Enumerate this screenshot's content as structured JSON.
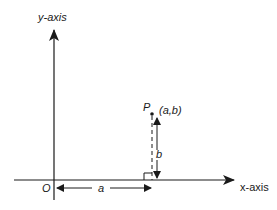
{
  "diagram": {
    "type": "coordinate-axes",
    "y_axis_label": "y-axis",
    "x_axis_label": "x-axis",
    "origin_label": "O",
    "point_label": "P",
    "point_coords": "(a,b)",
    "horizontal_distance_label": "a",
    "vertical_distance_label": "b",
    "colors": {
      "stroke": "#1a1a1a",
      "background": "#ffffff"
    }
  }
}
